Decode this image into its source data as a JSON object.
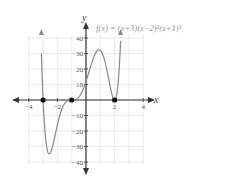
{
  "chart_data": {
    "type": "line",
    "title": "f(x) = (x+3)(x−2)²(x+1)³",
    "xlabel": "x",
    "ylabel": "y",
    "xlim": [
      -4.5,
      4.5
    ],
    "ylim": [
      -42,
      42
    ],
    "x_ticks": [
      -4,
      -2,
      2,
      4
    ],
    "y_ticks": [
      40,
      30,
      20,
      10,
      -10,
      -20,
      -30,
      -40
    ],
    "grid": true,
    "function": "(x+3)*(x-2)^2*(x+1)^3",
    "zeros": [
      {
        "x": -3,
        "y": 0
      },
      {
        "x": -1,
        "y": 0
      },
      {
        "x": 2,
        "y": 0
      }
    ],
    "series": [
      {
        "name": "f(x)",
        "x_range": [
          -3.12,
          2.42
        ]
      }
    ],
    "colors": {
      "curve": "#888888",
      "axis": "#333333",
      "grid": "#dddddd",
      "point": "#111111"
    }
  }
}
